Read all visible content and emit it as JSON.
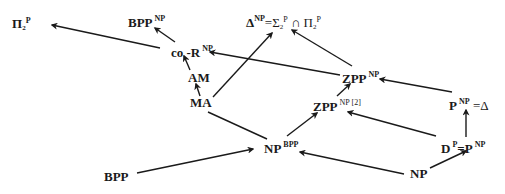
{
  "diagram": {
    "title": "",
    "nodes": {
      "pi2p": {
        "base": "Π",
        "sub": "2",
        "sup": "P"
      },
      "bpp_np": {
        "base": "BPP",
        "sup": "NP"
      },
      "delta_np": {
        "base": "Δ",
        "sup": "NP",
        "rest": "=Σ",
        "sub2": "2",
        "sup2": "P",
        "cap": " ∩ Π",
        "sub3": "2",
        "sup3": "P"
      },
      "cor_np": {
        "base": "co -R",
        "sup": "NP"
      },
      "am": {
        "base": "AM"
      },
      "ma": {
        "base": "MA"
      },
      "zpp_np": {
        "base": "ZPP",
        "sup": "NP"
      },
      "zpp_np2": {
        "base": "ZPP",
        "sup": "NP [2]"
      },
      "p_np": {
        "base": "P",
        "sup": "NP",
        "rest": " =Δ"
      },
      "np_bpp": {
        "base": "NP",
        "sup": "BPP"
      },
      "dp": {
        "base": "D",
        "sup": "P",
        "rest": "=P",
        "sup2": "NP"
      },
      "bpp": {
        "base": "BPP"
      },
      "np": {
        "base": "NP"
      }
    },
    "edges": [
      {
        "from": "co-R^NP",
        "to": "Π2P"
      },
      {
        "from": "co-R^NP",
        "to": "BPP^NP"
      },
      {
        "from": "AM",
        "to": "co-R^NP"
      },
      {
        "from": "MA",
        "to": "AM"
      },
      {
        "from": "MA",
        "to": "Δ^NP"
      },
      {
        "from": "ZPP^NP",
        "to": "co-R^NP"
      },
      {
        "from": "ZPP^NP",
        "to": "Δ^NP"
      },
      {
        "from": "ZPP^NP[2]",
        "to": "ZPP^NP"
      },
      {
        "from": "P^NP",
        "to": "ZPP^NP"
      },
      {
        "from": "NP^BPP",
        "to": "ZPP^NP[2]"
      },
      {
        "from": "MA",
        "to": "NP^BPP",
        "arrow": false
      },
      {
        "from": "BPP",
        "to": "NP^BPP"
      },
      {
        "from": "D^P",
        "to": "ZPP^NP[2]"
      },
      {
        "from": "NP",
        "to": "NP^BPP"
      },
      {
        "from": "NP",
        "to": "D^P"
      },
      {
        "from": "D^P",
        "to": "P^NP"
      }
    ],
    "colors": {
      "ink": "#1a1a1a",
      "background": "#ffffff"
    }
  }
}
